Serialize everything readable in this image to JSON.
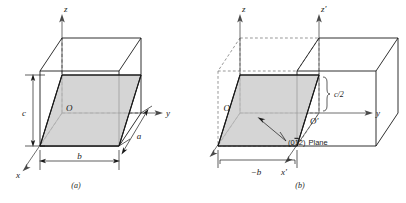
{
  "figure": {
    "type": "crystallography-plane-diagram",
    "background_color": "#ffffff",
    "line_color": "#1a1a1a",
    "dashed_color": "#4a4a4a",
    "shade_color": "#c9c9c9",
    "panels": [
      {
        "id": "a",
        "caption": "(a)",
        "axes": [
          {
            "name": "z-axis",
            "label": "z"
          },
          {
            "name": "y-axis",
            "label": "y"
          },
          {
            "name": "x-axis",
            "label": "x"
          }
        ],
        "origin_label": "O",
        "dimensions": [
          {
            "name": "height-dimension",
            "label": "c"
          },
          {
            "name": "width-dimension",
            "label": "b"
          },
          {
            "name": "depth-dimension",
            "label": "a"
          }
        ]
      },
      {
        "id": "b",
        "caption": "(b)",
        "axes": [
          {
            "name": "z-axis",
            "label": "z"
          },
          {
            "name": "z-prime-axis",
            "label": "z'"
          },
          {
            "name": "y-axis",
            "label": "y"
          },
          {
            "name": "x-axis",
            "label": "x"
          },
          {
            "name": "x-prime-axis",
            "label": "x'"
          }
        ],
        "origin_label": "O",
        "origin_prime_label": "O'",
        "dimensions": [
          {
            "name": "half-height-dimension",
            "label": "c/2"
          },
          {
            "name": "negative-width-dimension",
            "label": "−b"
          }
        ],
        "annotation": {
          "name": "plane-annotation",
          "miller_prefix": "(0",
          "miller_barred": "1",
          "miller_suffix": "2)",
          "text": "Plane",
          "full": "(01̅2) Plane"
        }
      }
    ]
  }
}
